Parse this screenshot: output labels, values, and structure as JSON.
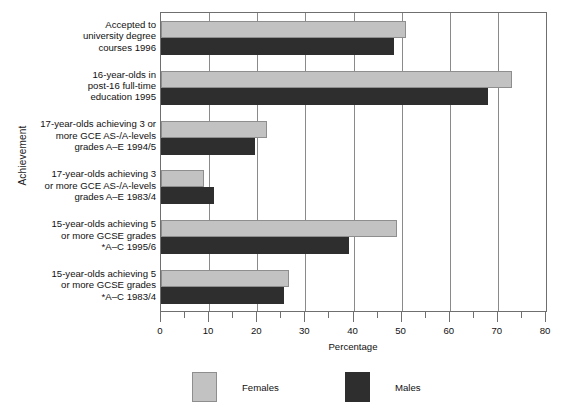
{
  "chart_data": {
    "type": "bar",
    "orientation": "horizontal",
    "title": "",
    "xlabel": "Percentage",
    "ylabel": "Achievement",
    "xlim": [
      0,
      80
    ],
    "xticks": [
      0,
      10,
      20,
      30,
      40,
      50,
      60,
      70,
      80
    ],
    "xticklabels": [
      "0",
      "10",
      "20",
      "30",
      "40",
      "50",
      "60",
      "70",
      "80"
    ],
    "minor_tick_step": 5,
    "grid": "vertical-major",
    "legend_position": "bottom",
    "categories": [
      "Accepted to university degree courses 1996",
      "16-year-olds in post-16  full-time education 1995",
      "17-year-olds achieving 3 or more GCE AS-/A-levels grades A–E 1994/5",
      "17-year-olds achieving 3 or more GCE AS-/A-levels grades A–E 1983/4",
      "15-year-olds achieving 5 or more GCSE grades *A–C 1995/6",
      "15-year-olds achieving 5 or more GCSE grades *A–C 1983/4"
    ],
    "category_lines": [
      [
        "Accepted to",
        "university degree",
        "courses 1996"
      ],
      [
        "16-year-olds in",
        "post-16  full-time",
        "education 1995"
      ],
      [
        "17-year-olds achieving 3 or",
        "more GCE AS-/A-levels",
        "grades A–E 1994/5"
      ],
      [
        "17-year-olds achieving 3",
        "or more GCE AS-/A-levels",
        "grades A–E 1983/4"
      ],
      [
        "15-year-olds achieving 5",
        "or more GCSE grades",
        "*A–C 1995/6"
      ],
      [
        "15-year-olds achieving 5",
        "or more GCSE grades",
        "*A–C 1983/4"
      ]
    ],
    "series": [
      {
        "name": "Females",
        "color": "#c2c2c2",
        "values": [
          51,
          73,
          22,
          9,
          49,
          26.5
        ]
      },
      {
        "name": "Males",
        "color": "#2e2e2e",
        "values": [
          48.5,
          68,
          19.5,
          11,
          39,
          25.5
        ]
      }
    ]
  },
  "legend": {
    "items": [
      {
        "label": "Females",
        "swatch": "females"
      },
      {
        "label": "Males",
        "swatch": "males"
      }
    ]
  }
}
